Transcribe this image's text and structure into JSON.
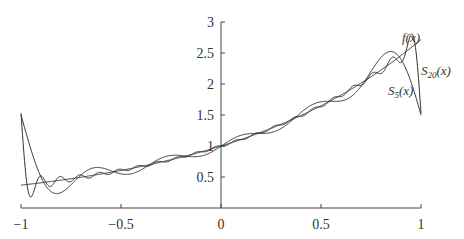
{
  "chart_data": {
    "type": "line",
    "title": "",
    "xlabel": "",
    "ylabel": "",
    "xlim": [
      -1,
      1
    ],
    "ylim": [
      0,
      3
    ],
    "grid": false,
    "x_ticks": [
      "-1",
      "-0.5",
      "0",
      "0.5",
      "1"
    ],
    "x_tick_values": [
      -1,
      -0.5,
      0,
      0.5,
      1
    ],
    "y_ticks": [
      "0.5",
      "1",
      "1.5",
      "2",
      "2.5",
      "3"
    ],
    "y_tick_values": [
      0.5,
      1,
      1.5,
      2,
      2.5,
      3
    ],
    "annotations": [
      {
        "text": "f(x)",
        "x": 0.98,
        "y": 2.75
      },
      {
        "text": "S5(x)",
        "x": 0.83,
        "y": 1.95
      },
      {
        "text": "S20(x)",
        "x": 0.98,
        "y": 2.2
      }
    ],
    "series": [
      {
        "name": "f(x)",
        "function": "e^x",
        "x": [
          -1,
          -0.75,
          -0.5,
          -0.25,
          0,
          0.25,
          0.5,
          0.75,
          1
        ],
        "values": [
          0.37,
          0.47,
          0.61,
          0.78,
          1.0,
          1.28,
          1.65,
          2.12,
          2.72
        ]
      },
      {
        "name": "S5(x)",
        "terms": 5,
        "x": [
          -1,
          -0.9,
          -0.75,
          -0.5,
          -0.25,
          0,
          0.25,
          0.5,
          0.75,
          0.85,
          1
        ],
        "values": [
          1.54,
          0.62,
          0.25,
          0.72,
          0.74,
          1.05,
          1.22,
          1.67,
          2.25,
          2.5,
          1.54
        ]
      },
      {
        "name": "S20(x)",
        "terms": 20,
        "x": [
          -1,
          -0.97,
          -0.9,
          -0.75,
          -0.5,
          0,
          0.5,
          0.9,
          0.97,
          1
        ],
        "values": [
          1.54,
          0.2,
          0.45,
          0.45,
          0.6,
          1.0,
          1.65,
          2.4,
          2.8,
          1.54
        ]
      }
    ]
  },
  "labels": {
    "f": "f(x)",
    "s5_main": "S",
    "s5_sub": "5",
    "s5_tail": "(x)",
    "s20_main": "S",
    "s20_sub": "20",
    "s20_tail": "(x)"
  },
  "colors": {
    "axis": "#444444",
    "curve": "#333333"
  }
}
